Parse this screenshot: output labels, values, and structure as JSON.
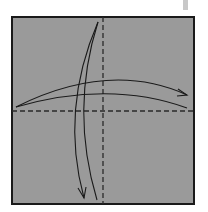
{
  "diagram": {
    "type": "origami-fold-diagram",
    "paper_color": "#9a9a9a",
    "line_color": "#1a1a1a",
    "tab_color": "#c8c8c8",
    "square": {
      "x": 11,
      "y": 16,
      "width": 184,
      "height": 189
    },
    "fold_lines": [
      {
        "name": "vertical-valley-fold",
        "style": "dashed",
        "x1": 103,
        "y1": 16,
        "x2": 103,
        "y2": 205
      },
      {
        "name": "horizontal-valley-fold",
        "style": "dashed",
        "x1": 11,
        "y1": 111,
        "x2": 195,
        "y2": 111
      }
    ],
    "arrows": [
      {
        "name": "fold-right-arrow",
        "direction": "left-to-right"
      },
      {
        "name": "fold-down-arrow",
        "direction": "top-to-bottom"
      }
    ]
  }
}
